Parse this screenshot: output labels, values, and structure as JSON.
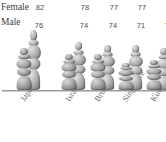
{
  "chart": {
    "type": "pictograph",
    "background_color": "#ffffff",
    "figure_color": "#8f8f8f",
    "baseline_color": "#9a9a9a"
  },
  "legend": {
    "female_label": "Female",
    "male_label": "Male"
  },
  "chart_data": {
    "type": "bar",
    "title": "",
    "subtitle": "",
    "xlabel": "",
    "ylabel": "",
    "grid": false,
    "legend_position": "left",
    "categories": [
      "Japan",
      "Israel",
      "Brunei",
      "Singapore",
      "Kuwait"
    ],
    "series": [
      {
        "name": "Female",
        "values": [
          82,
          78,
          77,
          77,
          76
        ]
      },
      {
        "name": "Male",
        "values": [
          76,
          74,
          74,
          71,
          72
        ]
      }
    ],
    "ylim": [
      0,
      85
    ],
    "annotations": []
  }
}
